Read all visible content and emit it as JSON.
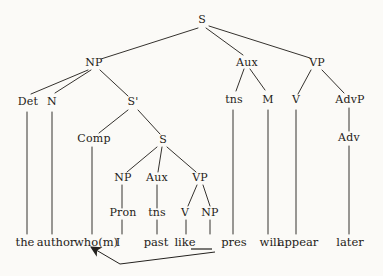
{
  "figure": {
    "background": "#fbfaf7",
    "ink": "#1f1c18",
    "line_color": "#35322e"
  },
  "tree": {
    "nodes": [
      {
        "id": "s-root",
        "label": "S",
        "x": 202,
        "y": 23
      },
      {
        "id": "np-subject",
        "label": "NP",
        "x": 94,
        "y": 66
      },
      {
        "id": "aux-main",
        "label": "Aux",
        "x": 247,
        "y": 66
      },
      {
        "id": "vp-main",
        "label": "VP",
        "x": 317,
        "y": 66
      },
      {
        "id": "det",
        "label": "Det",
        "x": 28,
        "y": 105
      },
      {
        "id": "n",
        "label": "N",
        "x": 52,
        "y": 105
      },
      {
        "id": "s-bar",
        "label": "S'",
        "x": 133,
        "y": 105
      },
      {
        "id": "tns-main",
        "label": "tns",
        "x": 234,
        "y": 103
      },
      {
        "id": "m",
        "label": "M",
        "x": 268,
        "y": 103
      },
      {
        "id": "v-main",
        "label": "V",
        "x": 296,
        "y": 103
      },
      {
        "id": "advp",
        "label": "AdvP",
        "x": 350,
        "y": 103
      },
      {
        "id": "comp",
        "label": "Comp",
        "x": 94,
        "y": 142
      },
      {
        "id": "s-embedded",
        "label": "S",
        "x": 163,
        "y": 143
      },
      {
        "id": "adv",
        "label": "Adv",
        "x": 349,
        "y": 141
      },
      {
        "id": "np-embedded",
        "label": "NP",
        "x": 123,
        "y": 181
      },
      {
        "id": "aux-embedded",
        "label": "Aux",
        "x": 157,
        "y": 181
      },
      {
        "id": "vp-embedded",
        "label": "VP",
        "x": 200,
        "y": 181
      },
      {
        "id": "pron",
        "label": "Pron",
        "x": 123,
        "y": 216
      },
      {
        "id": "tns-embedded",
        "label": "tns",
        "x": 157,
        "y": 216
      },
      {
        "id": "v-embedded",
        "label": "V",
        "x": 185,
        "y": 216
      },
      {
        "id": "np-object",
        "label": "NP",
        "x": 210,
        "y": 216
      }
    ],
    "terminals": [
      {
        "id": "the",
        "label": "the",
        "x": 25,
        "y": 246
      },
      {
        "id": "author",
        "label": "author",
        "x": 56,
        "y": 246
      },
      {
        "id": "whom",
        "label": "who(m)",
        "x": 96,
        "y": 246
      },
      {
        "id": "i",
        "label": "I",
        "x": 118,
        "y": 246
      },
      {
        "id": "past",
        "label": "past",
        "x": 156,
        "y": 246
      },
      {
        "id": "like",
        "label": "like",
        "x": 185,
        "y": 246
      },
      {
        "id": "pres",
        "label": "pres",
        "x": 234,
        "y": 246
      },
      {
        "id": "will",
        "label": "will",
        "x": 270,
        "y": 246
      },
      {
        "id": "appear",
        "label": "appear",
        "x": 298,
        "y": 246
      },
      {
        "id": "later",
        "label": "later",
        "x": 350,
        "y": 246
      }
    ],
    "edges": [
      [
        198,
        28,
        101,
        59
      ],
      [
        206,
        28,
        243,
        55
      ],
      [
        209,
        26,
        310,
        58
      ],
      [
        88,
        70,
        31,
        94
      ],
      [
        91,
        70,
        55,
        93
      ],
      [
        100,
        70,
        128,
        96
      ],
      [
        244,
        69,
        236,
        91
      ],
      [
        250,
        69,
        265,
        90
      ],
      [
        311,
        70,
        298,
        94
      ],
      [
        322,
        70,
        344,
        93
      ],
      [
        128,
        110,
        99,
        133
      ],
      [
        138,
        110,
        160,
        134
      ],
      [
        349,
        108,
        349,
        131
      ],
      [
        157,
        147,
        127,
        172
      ],
      [
        162,
        147,
        158,
        172
      ],
      [
        167,
        147,
        196,
        172
      ],
      [
        122,
        185,
        122,
        208
      ],
      [
        157,
        185,
        157,
        208
      ],
      [
        197,
        185,
        188,
        206
      ],
      [
        203,
        185,
        210,
        206
      ],
      [
        27,
        112,
        27,
        234
      ],
      [
        52,
        112,
        52,
        234
      ],
      [
        92,
        147,
        92,
        234
      ],
      [
        122,
        220,
        122,
        234
      ],
      [
        157,
        220,
        157,
        234
      ],
      [
        186,
        220,
        186,
        234
      ],
      [
        210,
        220,
        210,
        234
      ],
      [
        233,
        110,
        233,
        234
      ],
      [
        268,
        110,
        268,
        234
      ],
      [
        296,
        110,
        296,
        234
      ],
      [
        349,
        146,
        349,
        234
      ]
    ],
    "gap_underline": {
      "x1": 191,
      "y1": 249,
      "x2": 212,
      "y2": 249
    },
    "movement_arrow": {
      "points": "215,252 120,264 91,247"
    }
  }
}
